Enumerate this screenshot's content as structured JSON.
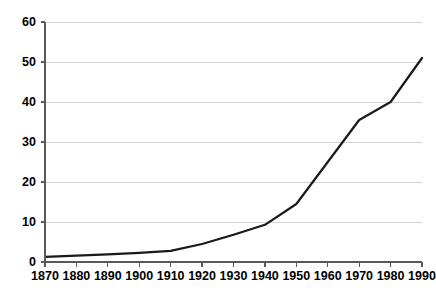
{
  "chart_data": {
    "type": "line",
    "title": "",
    "subtitle": "",
    "xlabel": "",
    "ylabel": "",
    "x": [
      1870,
      1880,
      1890,
      1900,
      1910,
      1920,
      1930,
      1940,
      1950,
      1960,
      1970,
      1980,
      1990
    ],
    "categories": [
      "1870",
      "1880",
      "1890",
      "1900",
      "1910",
      "1920",
      "1930",
      "1940",
      "1950",
      "1960",
      "1970",
      "1980",
      "1990"
    ],
    "series": [
      {
        "name": "series-1",
        "values": [
          1.3,
          1.6,
          1.9,
          2.3,
          2.8,
          4.5,
          6.8,
          9.3,
          14.5,
          25.0,
          35.5,
          40.0,
          51.0
        ]
      }
    ],
    "values": [
      1.3,
      1.6,
      1.9,
      2.3,
      2.8,
      4.5,
      6.8,
      9.3,
      14.5,
      25.0,
      35.5,
      40.0,
      51.0
    ],
    "xlim": [
      1870,
      1990
    ],
    "ylim": [
      0,
      60
    ],
    "y_ticks": [
      0,
      10,
      20,
      30,
      40,
      50,
      60
    ],
    "y_tick_labels": [
      "0",
      "10",
      "20",
      "30",
      "40",
      "50",
      "60"
    ],
    "x_ticks": [
      1870,
      1880,
      1890,
      1900,
      1910,
      1920,
      1930,
      1940,
      1950,
      1960,
      1970,
      1980,
      1990
    ],
    "x_tick_labels": [
      "1870",
      "1880",
      "1890",
      "1900",
      "1910",
      "1920",
      "1930",
      "1940",
      "1950",
      "1960",
      "1970",
      "1980",
      "1990"
    ],
    "grid": "horizontal",
    "legend": "none",
    "colors": {
      "line": "#1a1a1a",
      "grid": "#d4d4d4",
      "axis": "#595959",
      "background": "#ffffff",
      "text": "#000000"
    }
  }
}
